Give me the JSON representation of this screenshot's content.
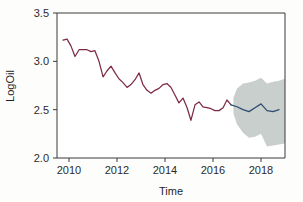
{
  "chart_data": {
    "type": "line",
    "title": "",
    "xlabel": "Time",
    "ylabel": "LogOil",
    "xlim": [
      2009.5,
      2019.0
    ],
    "ylim": [
      2.0,
      3.5
    ],
    "xticks": [
      2010,
      2012,
      2014,
      2016,
      2018
    ],
    "xtick_labels": [
      "2010",
      "2012",
      "2014",
      "2016",
      "2018"
    ],
    "yticks": [
      2.0,
      2.5,
      3.0,
      3.5
    ],
    "ytick_labels": [
      "2.0",
      "2.5",
      "3.0",
      "3.5"
    ],
    "grid": false,
    "legend": "none",
    "colors": {
      "historical_line": "#7d2b45",
      "forecast_line": "#2d4a73",
      "prediction_interval": "#c9cfcc",
      "axis": "#3a3a3a",
      "background": "#fdfdfc"
    },
    "series": [
      {
        "name": "Historical LogOil",
        "style": "line",
        "color": "#7d2b45",
        "x": [
          2009.75,
          2009.92,
          2010.08,
          2010.25,
          2010.42,
          2010.58,
          2010.75,
          2010.92,
          2011.08,
          2011.25,
          2011.42,
          2011.58,
          2011.75,
          2011.92,
          2012.08,
          2012.25,
          2012.42,
          2012.58,
          2012.75,
          2012.92,
          2013.08,
          2013.25,
          2013.42,
          2013.58,
          2013.75,
          2013.92,
          2014.08,
          2014.25,
          2014.42,
          2014.58,
          2014.75,
          2014.92,
          2015.08,
          2015.25,
          2015.42,
          2015.58,
          2015.75,
          2015.92,
          2016.08,
          2016.25,
          2016.42,
          2016.58,
          2016.75
        ],
        "y": [
          3.22,
          3.23,
          3.16,
          3.05,
          3.12,
          3.12,
          3.12,
          3.1,
          3.11,
          3.0,
          2.84,
          2.9,
          2.95,
          2.88,
          2.82,
          2.78,
          2.73,
          2.76,
          2.81,
          2.88,
          2.76,
          2.7,
          2.67,
          2.7,
          2.72,
          2.76,
          2.77,
          2.73,
          2.65,
          2.57,
          2.62,
          2.52,
          2.39,
          2.55,
          2.58,
          2.53,
          2.52,
          2.51,
          2.49,
          2.49,
          2.52,
          2.6,
          2.55
        ]
      },
      {
        "name": "Forecast LogOil",
        "style": "line",
        "color": "#2d4a73",
        "x": [
          2016.75,
          2017.0,
          2017.25,
          2017.5,
          2017.75,
          2018.0,
          2018.25,
          2018.5,
          2018.75
        ],
        "y": [
          2.55,
          2.53,
          2.5,
          2.48,
          2.52,
          2.56,
          2.49,
          2.48,
          2.5
        ]
      }
    ],
    "interval_band": {
      "name": "Prediction interval",
      "color": "#c9cfcc",
      "x": [
        2016.85,
        2017.0,
        2017.25,
        2017.5,
        2017.75,
        2018.0,
        2018.25,
        2018.5,
        2018.75,
        2019.0
      ],
      "lower": [
        2.46,
        2.35,
        2.26,
        2.21,
        2.22,
        2.25,
        2.12,
        2.13,
        2.14,
        2.15
      ],
      "upper": [
        2.62,
        2.72,
        2.77,
        2.78,
        2.8,
        2.83,
        2.77,
        2.79,
        2.8,
        2.82
      ]
    }
  }
}
